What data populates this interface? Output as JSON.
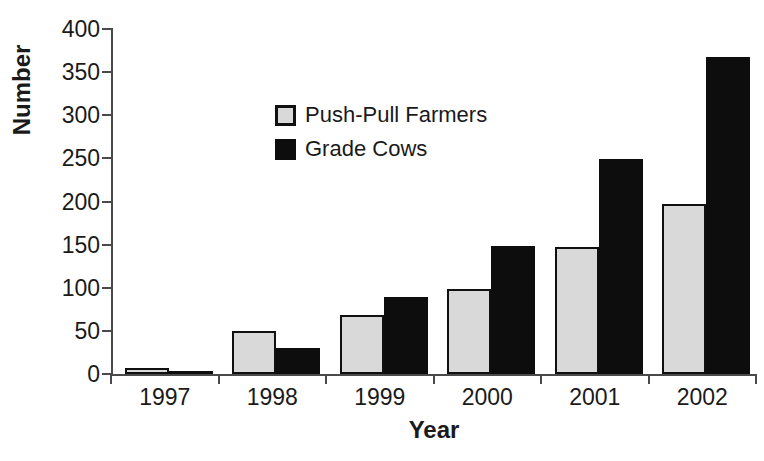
{
  "chart_data": {
    "type": "bar",
    "title": "",
    "xlabel": "Year",
    "ylabel": "Number",
    "categories": [
      "1997",
      "1998",
      "1999",
      "2000",
      "2001",
      "2002"
    ],
    "series": [
      {
        "name": "Push-Pull Farmers",
        "color": "#d9d9d9",
        "border_color": "#101010",
        "values": [
          7,
          50,
          69,
          98,
          147,
          197
        ]
      },
      {
        "name": "Grade Cows",
        "color": "#0d0d0d",
        "border_color": "#0d0d0d",
        "values": [
          4,
          30,
          89,
          149,
          249,
          368
        ]
      }
    ],
    "ylim": [
      0,
      400
    ],
    "yticks": [
      0,
      50,
      100,
      150,
      200,
      250,
      300,
      350,
      400
    ],
    "ytick_labels": [
      "0",
      "50",
      "100",
      "150",
      "200",
      "250",
      "300",
      "350",
      "400"
    ],
    "grid": false,
    "legend_position": "upper center-left",
    "axis_color": "#4a4a4a"
  },
  "caption": {
    "text": ""
  }
}
